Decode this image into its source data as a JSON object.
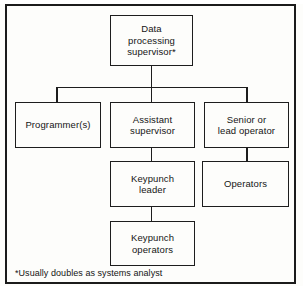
{
  "figure": {
    "type": "organization-chart",
    "title_visible": false,
    "footnote": "*Usually doubles as systems analyst",
    "border_color": "#1b1b1b",
    "box_border_color": "#1d1d1d",
    "background_color": "#fdfdfb",
    "text_color": "#151515"
  },
  "nodes": {
    "supervisor": {
      "label": "Data\nprocessing\nsupervisor*",
      "level": 1
    },
    "programmer": {
      "label": "Programmer(s)",
      "level": 2
    },
    "assistant_supervisor": {
      "label": "Assistant\nsupervisor",
      "level": 2
    },
    "senior_operator": {
      "label": "Senior or\nlead operator",
      "level": 2
    },
    "keypunch_leader": {
      "label": "Keypunch\nleader",
      "level": 3
    },
    "operators": {
      "label": "Operators",
      "level": 3
    },
    "keypunch_operators": {
      "label": "Keypunch\noperators",
      "level": 4
    }
  },
  "edges": [
    {
      "from": "supervisor",
      "to": "programmer"
    },
    {
      "from": "supervisor",
      "to": "assistant_supervisor"
    },
    {
      "from": "supervisor",
      "to": "senior_operator"
    },
    {
      "from": "assistant_supervisor",
      "to": "keypunch_leader"
    },
    {
      "from": "senior_operator",
      "to": "operators"
    },
    {
      "from": "keypunch_leader",
      "to": "keypunch_operators"
    }
  ]
}
